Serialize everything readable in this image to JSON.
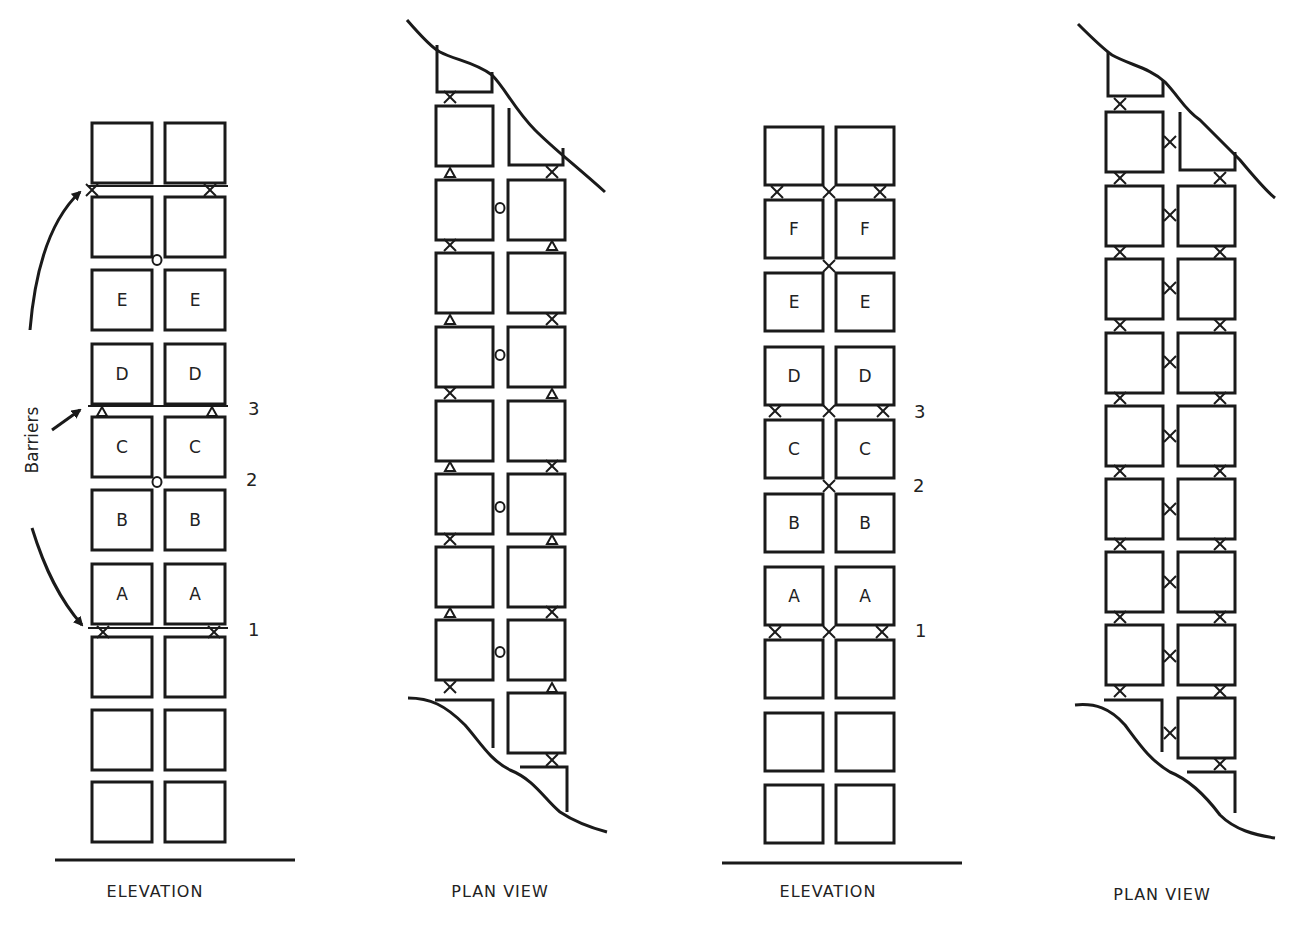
{
  "panels": [
    {
      "id": "elevation-1",
      "caption": "ELEVATION",
      "caption_x": 155,
      "caption_y": 897,
      "col_x": [
        92,
        165
      ],
      "block_w": 60,
      "row_y": [
        123,
        197,
        270,
        344,
        417,
        490,
        564,
        637,
        710,
        782
      ],
      "block_h": 60,
      "labels": [
        [
          "",
          ""
        ],
        [
          "",
          ""
        ],
        [
          "E",
          "E"
        ],
        [
          "D",
          "D"
        ],
        [
          "C",
          "C"
        ],
        [
          "B",
          "B"
        ],
        [
          "A",
          "A"
        ],
        [
          "",
          ""
        ],
        [
          "",
          ""
        ],
        [
          "",
          ""
        ]
      ],
      "ground": {
        "x1": 55,
        "x2": 295,
        "y": 860
      },
      "barrier_lines": [
        {
          "y": 186,
          "x1": 88,
          "x2": 228
        },
        {
          "y": 406,
          "x1": 88,
          "x2": 228
        },
        {
          "y": 628,
          "x1": 88,
          "x2": 228
        }
      ],
      "connectors": [
        {
          "type": "x",
          "x": 92,
          "y": 190
        },
        {
          "type": "x",
          "x": 210,
          "y": 190
        },
        {
          "type": "o",
          "x": 157,
          "y": 260
        },
        {
          "type": "tri",
          "x": 102,
          "y": 411
        },
        {
          "type": "tri",
          "x": 212,
          "y": 411
        },
        {
          "type": "o",
          "x": 157,
          "y": 482
        },
        {
          "type": "x",
          "x": 103,
          "y": 632
        },
        {
          "type": "x",
          "x": 214,
          "y": 632
        }
      ],
      "side_numbers": [
        {
          "text": "3",
          "x": 248,
          "y": 415
        },
        {
          "text": "2",
          "x": 246,
          "y": 486
        },
        {
          "text": "1",
          "x": 248,
          "y": 636
        }
      ],
      "side_label": {
        "text": "Barriers",
        "x": 38,
        "y": 440
      }
    },
    {
      "id": "plan-view-1",
      "caption": "PLAN VIEW",
      "caption_x": 500,
      "caption_y": 897,
      "connector_style": "mixed"
    },
    {
      "id": "elevation-2",
      "caption": "ELEVATION",
      "caption_x": 828,
      "caption_y": 897,
      "col_x": [
        765,
        836
      ],
      "block_w": 58,
      "row_y": [
        127,
        200,
        273,
        347,
        420,
        494,
        567,
        640,
        713,
        785
      ],
      "block_h": 58,
      "labels": [
        [
          "",
          ""
        ],
        [
          "F",
          "F"
        ],
        [
          "E",
          "E"
        ],
        [
          "D",
          "D"
        ],
        [
          "C",
          "C"
        ],
        [
          "B",
          "B"
        ],
        [
          "A",
          "A"
        ],
        [
          "",
          ""
        ],
        [
          "",
          ""
        ],
        [
          "",
          ""
        ]
      ],
      "ground": {
        "x1": 722,
        "x2": 962,
        "y": 863
      },
      "connectors": [
        {
          "type": "x",
          "x": 777,
          "y": 192
        },
        {
          "type": "x",
          "x": 829,
          "y": 192
        },
        {
          "type": "x",
          "x": 880,
          "y": 192
        },
        {
          "type": "x",
          "x": 829,
          "y": 266
        },
        {
          "type": "x",
          "x": 775,
          "y": 411
        },
        {
          "type": "x",
          "x": 829,
          "y": 411
        },
        {
          "type": "x",
          "x": 883,
          "y": 411
        },
        {
          "type": "x",
          "x": 829,
          "y": 486
        },
        {
          "type": "x",
          "x": 775,
          "y": 632
        },
        {
          "type": "x",
          "x": 829,
          "y": 632
        },
        {
          "type": "x",
          "x": 882,
          "y": 632
        }
      ],
      "side_numbers": [
        {
          "text": "3",
          "x": 914,
          "y": 418
        },
        {
          "text": "2",
          "x": 913,
          "y": 492
        },
        {
          "text": "1",
          "x": 915,
          "y": 637
        }
      ]
    },
    {
      "id": "plan-view-2",
      "caption": "PLAN VIEW",
      "caption_x": 1162,
      "caption_y": 900,
      "connector_style": "all-x"
    }
  ]
}
